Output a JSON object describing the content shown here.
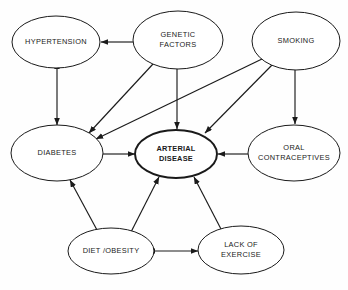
{
  "diagram": {
    "type": "directed-graph",
    "background_color": "#fefefe",
    "stroke_color": "#1a1a1a",
    "nodes": [
      {
        "id": "hypertension",
        "label": "HYPERTENSION",
        "lines": [
          "HYPERTENSION"
        ],
        "cx": 56,
        "cy": 42,
        "rx": 44,
        "ry": 26,
        "emphasis": false
      },
      {
        "id": "genetic_factors",
        "label": "GENETIC FACTORS",
        "lines": [
          "GENETIC",
          "FACTORS"
        ],
        "cx": 178,
        "cy": 40,
        "rx": 45,
        "ry": 29,
        "emphasis": false
      },
      {
        "id": "smoking",
        "label": "SMOKING",
        "lines": [
          "SMOKING"
        ],
        "cx": 296,
        "cy": 41,
        "rx": 44,
        "ry": 29,
        "emphasis": false
      },
      {
        "id": "diabetes",
        "label": "DIABETES",
        "lines": [
          "DIABETES"
        ],
        "cx": 57,
        "cy": 153,
        "rx": 46,
        "ry": 28,
        "emphasis": false
      },
      {
        "id": "arterial_disease",
        "label": "ARTERIAL DISEASE",
        "lines": [
          "ARTERIAL",
          "DISEASE"
        ],
        "cx": 176,
        "cy": 154,
        "rx": 41,
        "ry": 24,
        "emphasis": true
      },
      {
        "id": "oral_contraceptives",
        "label": "ORAL CONTRACEPTIVES",
        "lines": [
          "ORAL",
          "CONTRACEPTIVES"
        ],
        "cx": 294,
        "cy": 153,
        "rx": 46,
        "ry": 28,
        "emphasis": false
      },
      {
        "id": "diet_obesity",
        "label": "DIET /OBESITY",
        "lines": [
          "DIET /OBESITY"
        ],
        "cx": 111,
        "cy": 251,
        "rx": 43,
        "ry": 23,
        "emphasis": false
      },
      {
        "id": "lack_of_exercise",
        "label": "LACK OF EXERCISE",
        "lines": [
          "LACK OF",
          "EXERCISE"
        ],
        "cx": 241,
        "cy": 250,
        "rx": 43,
        "ry": 24,
        "emphasis": false
      }
    ],
    "edges": [
      {
        "id": "genetic-to-hypertension",
        "from": "genetic_factors",
        "to": "hypertension",
        "direction": "one-way",
        "x1": 133,
        "y1": 42,
        "x2": 101,
        "y2": 42
      },
      {
        "id": "genetic-to-diabetes",
        "from": "genetic_factors",
        "to": "diabetes",
        "direction": "one-way",
        "x1": 153,
        "y1": 64,
        "x2": 89,
        "y2": 133
      },
      {
        "id": "genetic-to-arterial",
        "from": "genetic_factors",
        "to": "arterial_disease",
        "direction": "one-way",
        "x1": 177,
        "y1": 69,
        "x2": 177,
        "y2": 129
      },
      {
        "id": "smoking-to-diabetes",
        "from": "smoking",
        "to": "diabetes",
        "direction": "one-way",
        "x1": 262,
        "y1": 59,
        "x2": 96,
        "y2": 139
      },
      {
        "id": "smoking-to-arterial",
        "from": "smoking",
        "to": "arterial_disease",
        "direction": "one-way",
        "x1": 274,
        "y1": 63,
        "x2": 205,
        "y2": 133
      },
      {
        "id": "smoking-to-oral",
        "from": "smoking",
        "to": "oral_contraceptives",
        "direction": "one-way",
        "x1": 295,
        "y1": 70,
        "x2": 295,
        "y2": 124
      },
      {
        "id": "hypertension-diabetes",
        "from": "hypertension",
        "to": "diabetes",
        "direction": "two-way",
        "x1": 57,
        "y1": 69,
        "x2": 57,
        "y2": 125
      },
      {
        "id": "diabetes-to-arterial",
        "from": "diabetes",
        "to": "arterial_disease",
        "direction": "one-way",
        "x1": 103,
        "y1": 154,
        "x2": 135,
        "y2": 154
      },
      {
        "id": "oral-to-arterial",
        "from": "oral_contraceptives",
        "to": "arterial_disease",
        "direction": "one-way",
        "x1": 248,
        "y1": 154,
        "x2": 218,
        "y2": 154
      },
      {
        "id": "diet-to-diabetes",
        "from": "diet_obesity",
        "to": "diabetes",
        "direction": "one-way",
        "x1": 97,
        "y1": 230,
        "x2": 70,
        "y2": 180
      },
      {
        "id": "diet-to-arterial",
        "from": "diet_obesity",
        "to": "arterial_disease",
        "direction": "one-way",
        "x1": 131,
        "y1": 232,
        "x2": 159,
        "y2": 177
      },
      {
        "id": "exercise-to-arterial",
        "from": "lack_of_exercise",
        "to": "arterial_disease",
        "direction": "one-way",
        "x1": 222,
        "y1": 231,
        "x2": 194,
        "y2": 177
      },
      {
        "id": "diet-exercise",
        "from": "diet_obesity",
        "to": "lack_of_exercise",
        "direction": "two-way",
        "x1": 155,
        "y1": 251,
        "x2": 198,
        "y2": 251
      }
    ]
  }
}
